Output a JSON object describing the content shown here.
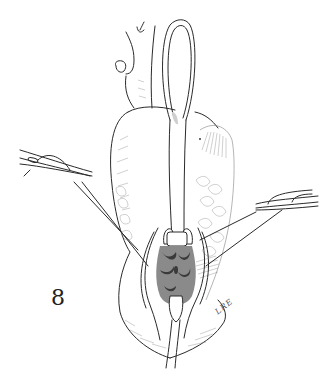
{
  "figure": {
    "label": "8",
    "signature": "LRE",
    "colors": {
      "background": "#ffffff",
      "ink": "#2a2a2a"
    },
    "elements": [
      "vessel-trunk-icon",
      "loop-retractor-icon",
      "left-clamp-icon",
      "right-clamp-icon",
      "traction-sutures",
      "exposed-tissue",
      "tube-drain"
    ]
  }
}
